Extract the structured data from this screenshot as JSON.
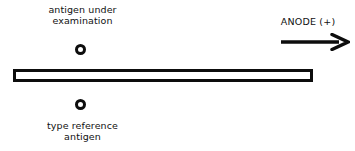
{
  "diagram": {
    "background_color": "#ffffff",
    "ink_color": "#0d0d0d",
    "top_label": {
      "line1": "antigen under",
      "line2": "examination"
    },
    "bottom_label": {
      "line1": "type reference",
      "line2": "antigen"
    },
    "anode": {
      "label": "ANODE (+)",
      "arrow_direction": "right"
    },
    "wells": [
      {
        "name": "antigen-under-examination-well",
        "shape": "circle"
      },
      {
        "name": "type-reference-antigen-well",
        "shape": "circle"
      }
    ],
    "slab": {
      "name": "agar-gel-slab",
      "shape": "rectangle"
    }
  }
}
